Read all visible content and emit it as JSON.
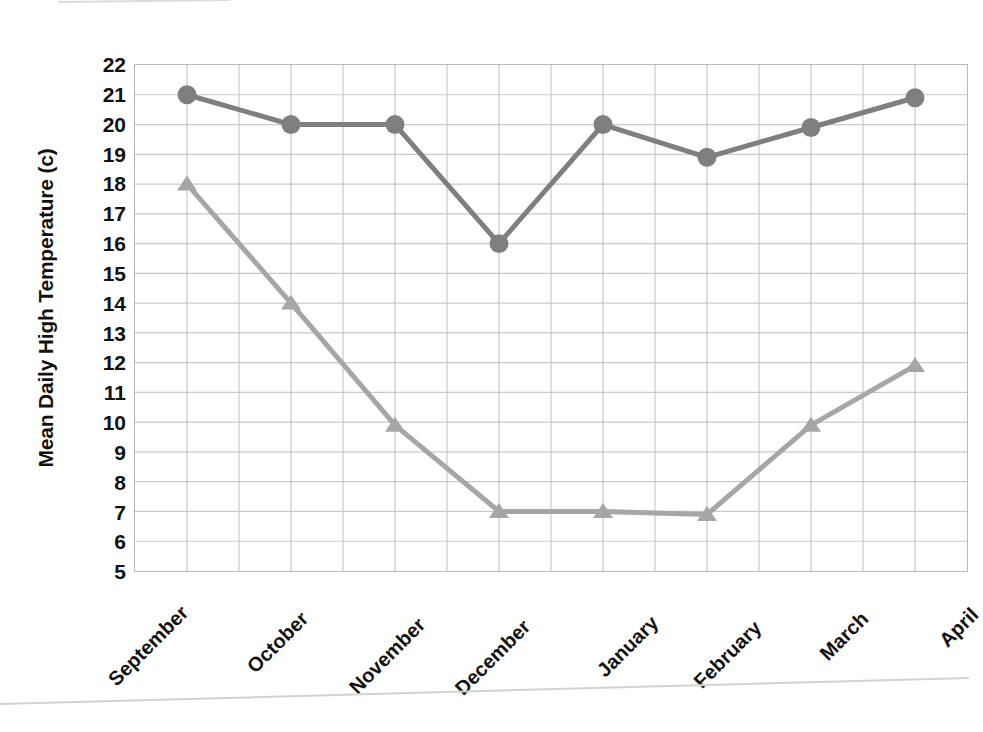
{
  "chart_data": {
    "type": "line",
    "title": "",
    "subtitle": "",
    "xlabel": "",
    "ylabel": "Mean Daily High Temperature (c)",
    "categories": [
      "September",
      "October",
      "November",
      "December",
      "January",
      "February",
      "March",
      "April"
    ],
    "ylim": [
      5,
      22
    ],
    "ytick_step": 1,
    "yticks": [
      "22",
      "21",
      "20",
      "19",
      "18",
      "17",
      "16",
      "15",
      "14",
      "13",
      "12",
      "11",
      "10",
      "9",
      "8",
      "7",
      "6",
      "5"
    ],
    "grid": "both",
    "legend": "none",
    "series": [
      {
        "name": "series-1-dark",
        "marker": "circle",
        "color": "#7f7f7f",
        "values": [
          21,
          20,
          20,
          16,
          20,
          18.9,
          19.9,
          20.9
        ]
      },
      {
        "name": "series-2-light",
        "marker": "triangle",
        "color": "#a6a6a6",
        "values": [
          18,
          14,
          9.9,
          7,
          7,
          6.9,
          9.9,
          11.9
        ]
      }
    ],
    "colors": {
      "series_dark": "#7f7f7f",
      "series_light": "#a6a6a6",
      "gridline": "#c9c9c9",
      "plot_border": "#b9b9b9",
      "text": "#111111",
      "background": "#ffffff"
    },
    "axes": {
      "x_gridline_count": 15,
      "y_gridline_count": 17
    }
  }
}
